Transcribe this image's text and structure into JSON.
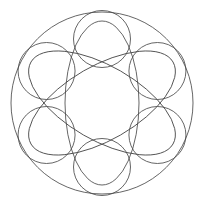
{
  "figure": {
    "background": "#ffffff",
    "stroke_color": "#4a4a4a",
    "center": [
      102,
      103
    ],
    "outer_circle": {
      "r": 91
    },
    "small_circles": {
      "r": 28.5,
      "distance_from_center": 64,
      "angles_deg": [
        -90,
        -30,
        30,
        90,
        150,
        210
      ]
    },
    "ellipses": {
      "rx": 37,
      "ry": 82,
      "rotations_deg": [
        0,
        60,
        120
      ]
    }
  }
}
